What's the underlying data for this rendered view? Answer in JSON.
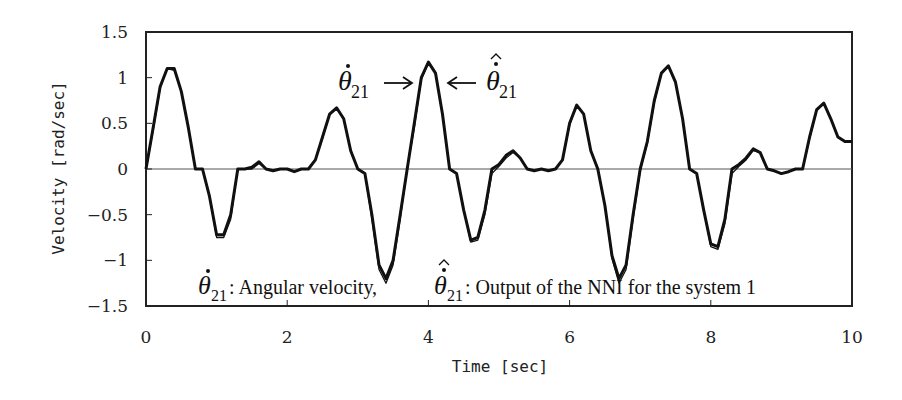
{
  "chart_data": {
    "type": "line",
    "title": "",
    "xlabel": "Time [sec]",
    "ylabel": "Velocity [rad/sec]",
    "xlim": [
      0,
      10
    ],
    "ylim": [
      -1.5,
      1.5
    ],
    "xticks": [
      0,
      2,
      4,
      6,
      8,
      10
    ],
    "xtick_labels": [
      "0",
      "2",
      "4",
      "6",
      "8",
      "10"
    ],
    "yticks": [
      1.5,
      1,
      0.5,
      0,
      -0.5,
      -1,
      -1.5
    ],
    "ytick_labels": [
      "1.5",
      "1",
      "0.5",
      "0",
      "-0.5",
      "-1",
      "-1.5"
    ],
    "grid": false,
    "zero_line": true,
    "legend": "none (inline annotations)",
    "annotations": [
      {
        "text": "θ̇21 →",
        "x": 3.6,
        "y": 1.05
      },
      {
        "text": "← θ̂̇21",
        "x": 4.4,
        "y": 1.05
      },
      {
        "text": "θ̇21 : Angular velocity,  θ̂̇21 : Output of the NNI for the system 1",
        "x": 0.4,
        "y": -1.32
      }
    ],
    "series": [
      {
        "name": "θ̇21 (Angular velocity)",
        "style": "thick black",
        "x": [
          0,
          0.1,
          0.2,
          0.3,
          0.4,
          0.5,
          0.6,
          0.7,
          0.8,
          0.9,
          1.0,
          1.1,
          1.2,
          1.3,
          1.4,
          1.5,
          1.6,
          1.7,
          1.8,
          1.9,
          2.0,
          2.1,
          2.2,
          2.3,
          2.4,
          2.5,
          2.6,
          2.7,
          2.8,
          2.9,
          3.0,
          3.1,
          3.2,
          3.3,
          3.4,
          3.5,
          3.6,
          3.7,
          3.8,
          3.9,
          4.0,
          4.1,
          4.2,
          4.3,
          4.4,
          4.5,
          4.6,
          4.7,
          4.8,
          4.9,
          5.0,
          5.1,
          5.2,
          5.3,
          5.4,
          5.5,
          5.6,
          5.7,
          5.8,
          5.9,
          6.0,
          6.1,
          6.2,
          6.3,
          6.4,
          6.5,
          6.6,
          6.7,
          6.8,
          6.9,
          7.0,
          7.1,
          7.2,
          7.3,
          7.4,
          7.5,
          7.6,
          7.7,
          7.8,
          7.9,
          8.0,
          8.1,
          8.2,
          8.3,
          8.4,
          8.5,
          8.6,
          8.7,
          8.8,
          8.9,
          9.0,
          9.1,
          9.2,
          9.3,
          9.4,
          9.5,
          9.6,
          9.7,
          9.8,
          9.9,
          10.0
        ],
        "y": [
          0,
          0.45,
          0.9,
          1.1,
          1.1,
          0.85,
          0.45,
          0.0,
          0.0,
          -0.3,
          -0.72,
          -0.72,
          -0.5,
          0.0,
          0.0,
          0.02,
          0.08,
          0.0,
          -0.02,
          0.0,
          0.0,
          -0.03,
          0.0,
          0.0,
          0.1,
          0.35,
          0.6,
          0.67,
          0.55,
          0.2,
          0.0,
          -0.05,
          -0.5,
          -1.05,
          -1.2,
          -1.0,
          -0.5,
          0.0,
          0.5,
          1.0,
          1.17,
          1.05,
          0.6,
          0.0,
          -0.05,
          -0.45,
          -0.78,
          -0.75,
          -0.45,
          0.0,
          0.05,
          0.15,
          0.2,
          0.12,
          0.0,
          -0.02,
          0.0,
          -0.02,
          0.0,
          0.1,
          0.5,
          0.7,
          0.6,
          0.2,
          0.0,
          -0.4,
          -0.95,
          -1.2,
          -1.05,
          -0.5,
          0.0,
          0.3,
          0.75,
          1.05,
          1.13,
          0.95,
          0.55,
          0.0,
          -0.05,
          -0.45,
          -0.82,
          -0.85,
          -0.55,
          0.0,
          0.05,
          0.12,
          0.22,
          0.18,
          0.0,
          -0.02,
          -0.05,
          -0.03,
          0.0,
          0.0,
          0.35,
          0.65,
          0.72,
          0.55,
          0.35,
          0.3,
          0.3
        ]
      },
      {
        "name": "θ̂̇21 (Output of the NNI for the system 1)",
        "style": "thin black, nearly overlapping",
        "x": [
          0,
          0.1,
          0.2,
          0.3,
          0.4,
          0.5,
          0.6,
          0.7,
          0.8,
          0.9,
          1.0,
          1.1,
          1.2,
          1.3,
          1.4,
          1.5,
          1.6,
          1.7,
          1.8,
          1.9,
          2.0,
          2.1,
          2.2,
          2.3,
          2.4,
          2.5,
          2.6,
          2.7,
          2.8,
          2.9,
          3.0,
          3.1,
          3.2,
          3.3,
          3.4,
          3.5,
          3.6,
          3.7,
          3.8,
          3.9,
          4.0,
          4.1,
          4.2,
          4.3,
          4.4,
          4.5,
          4.6,
          4.7,
          4.8,
          4.9,
          5.0,
          5.1,
          5.2,
          5.3,
          5.4,
          5.5,
          5.6,
          5.7,
          5.8,
          5.9,
          6.0,
          6.1,
          6.2,
          6.3,
          6.4,
          6.5,
          6.6,
          6.7,
          6.8,
          6.9,
          7.0,
          7.1,
          7.2,
          7.3,
          7.4,
          7.5,
          7.6,
          7.7,
          7.8,
          7.9,
          8.0,
          8.1,
          8.2,
          8.3,
          8.4,
          8.5,
          8.6,
          8.7,
          8.8,
          8.9,
          9.0,
          9.1,
          9.2,
          9.3,
          9.4,
          9.5,
          9.6,
          9.7,
          9.8,
          9.9,
          10.0
        ],
        "y": [
          0,
          0.42,
          0.88,
          1.1,
          1.08,
          0.85,
          0.45,
          0.0,
          0.0,
          -0.3,
          -0.75,
          -0.75,
          -0.55,
          0.0,
          0.0,
          0.0,
          0.06,
          0.0,
          -0.02,
          0.0,
          0.0,
          -0.03,
          0.0,
          0.0,
          0.1,
          0.33,
          0.6,
          0.66,
          0.55,
          0.2,
          0.0,
          -0.05,
          -0.55,
          -1.1,
          -1.25,
          -1.05,
          -0.55,
          0.0,
          0.45,
          0.98,
          1.16,
          1.05,
          0.6,
          0.0,
          -0.05,
          -0.45,
          -0.8,
          -0.78,
          -0.5,
          -0.05,
          0.03,
          0.12,
          0.18,
          0.12,
          0.0,
          -0.02,
          0.0,
          -0.02,
          0.0,
          0.1,
          0.48,
          0.7,
          0.6,
          0.2,
          0.0,
          -0.4,
          -0.98,
          -1.25,
          -1.1,
          -0.55,
          -0.02,
          0.28,
          0.72,
          1.05,
          1.12,
          0.95,
          0.55,
          0.0,
          -0.05,
          -0.45,
          -0.85,
          -0.88,
          -0.6,
          -0.05,
          0.03,
          0.1,
          0.2,
          0.18,
          0.0,
          -0.02,
          -0.05,
          -0.03,
          0.0,
          0.0,
          0.33,
          0.64,
          0.72,
          0.55,
          0.35,
          0.3,
          0.3
        ]
      }
    ]
  },
  "labels": {
    "xlabel": "Time [sec]",
    "ylabel": "Velocity [rad/sec]",
    "anno_top_left_symbol": "θ",
    "anno_top_left_sub": "21",
    "anno_top_right_symbol": "θ",
    "anno_top_right_sub": "21",
    "anno_bottom_sym1": "θ",
    "anno_bottom_sub1": "21",
    "anno_bottom_text1": " : Angular velocity,",
    "anno_bottom_sym2": "θ",
    "anno_bottom_sub2": "21",
    "anno_bottom_text2": " : Output of the NNI for the system 1"
  },
  "colors": {
    "line": "#111111",
    "axis": "#222222",
    "zero_line": "#555555",
    "background": "#ffffff"
  }
}
